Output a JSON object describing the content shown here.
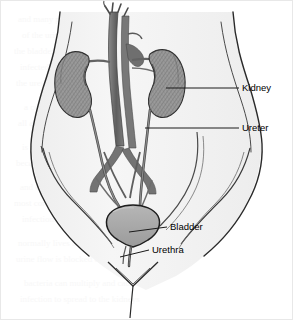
{
  "figure": {
    "type": "anatomical-illustration",
    "view": "anterior female torso, pelvis and abdomen",
    "background_color": "#ffffff",
    "frame_color": "#e3e3e3",
    "ink_color": "#1a1a1a",
    "body_fill": "#f4f4f4",
    "organ_fill": "#9a9a9a",
    "vessel_fill": "#6e6e6e",
    "bladder_fill": "#a8a8a8",
    "label_color": "#000000",
    "leader_color": "#1a1a1a"
  },
  "labels": [
    {
      "id": "kidney",
      "text": "Kidney",
      "text_x": 242,
      "text_y": 88,
      "leader_from_x": 166,
      "leader_from_y": 88,
      "leader_to_x": 239,
      "leader_to_y": 88,
      "target": "right kidney lateral border"
    },
    {
      "id": "ureter",
      "text": "Ureter",
      "text_x": 242,
      "text_y": 128,
      "leader_from_x": 145,
      "leader_from_y": 128,
      "leader_to_x": 239,
      "leader_to_y": 128,
      "target": "right ureter descending"
    },
    {
      "id": "bladder",
      "text": "Bladder",
      "text_x": 170,
      "text_y": 227,
      "leader_from_x": 129,
      "leader_from_y": 232,
      "leader_to_x": 167,
      "leader_to_y": 227,
      "target": "urinary bladder dome"
    },
    {
      "id": "urethra",
      "text": "Urethra",
      "text_x": 152,
      "text_y": 250,
      "leader_from_x": 120,
      "leader_from_y": 257,
      "leader_to_x": 149,
      "leader_to_y": 250,
      "target": "urethra outlet"
    }
  ],
  "structures": [
    {
      "id": "torso-outline",
      "name": "Abdomen and pelvis outline",
      "visible": true
    },
    {
      "id": "left-kidney",
      "name": "Left kidney",
      "visible": true
    },
    {
      "id": "right-kidney",
      "name": "Right kidney",
      "visible": true
    },
    {
      "id": "aorta",
      "name": "Abdominal aorta",
      "visible": true
    },
    {
      "id": "vena-cava",
      "name": "Inferior vena cava",
      "visible": true
    },
    {
      "id": "left-ureter",
      "name": "Left ureter",
      "visible": true
    },
    {
      "id": "right-ureter",
      "name": "Right ureter",
      "visible": true
    },
    {
      "id": "bladder",
      "name": "Urinary bladder",
      "visible": true
    },
    {
      "id": "urethra",
      "name": "Urethra",
      "visible": true
    },
    {
      "id": "iliac-vessels",
      "name": "Common iliac vessels",
      "visible": true
    }
  ],
  "ghost_lines": [
    "and many people who suffer from the pain",
    "of the urinary tract infection. Usually a",
    "the bladder and the kidneys can become",
    "infected when bacteria travel upward from",
    "the urethra into the bladder and then",
    "a common problem among the people of",
    "all ages and in both sexes. However it",
    "is more common in women than in men",
    "because the female urethra is shorter",
    "and closer to the anus. The bacteria",
    "most commonly responsible for these",
    "infections is Escherichia coli which",
    "normally lives in the colon. When the",
    "urine flow is blocked or slowed the",
    "bacteria can multiply and cause the",
    "infection to spread to the kidneys"
  ]
}
